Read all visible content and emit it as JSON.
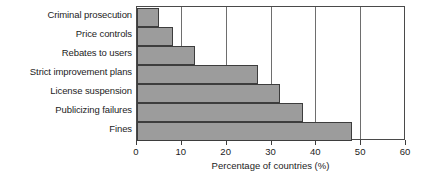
{
  "chart_data": {
    "type": "bar",
    "orientation": "horizontal",
    "title": "",
    "xlabel": "Percentage of countries (%)",
    "ylabel": "",
    "xlim": [
      0,
      60
    ],
    "xticks": [
      0,
      10,
      20,
      30,
      40,
      50,
      60
    ],
    "grid": "vertical",
    "legend": "none",
    "bar_color": "#9c9c9c",
    "bar_edge_color": "#3d3d3d",
    "categories": [
      "Criminal prosecution",
      "Price controls",
      "Rebates to users",
      "Strict improvement plans",
      "License suspension",
      "Publicizing failures",
      "Fines"
    ],
    "values": [
      5,
      8,
      13,
      27,
      32,
      37,
      48
    ]
  }
}
